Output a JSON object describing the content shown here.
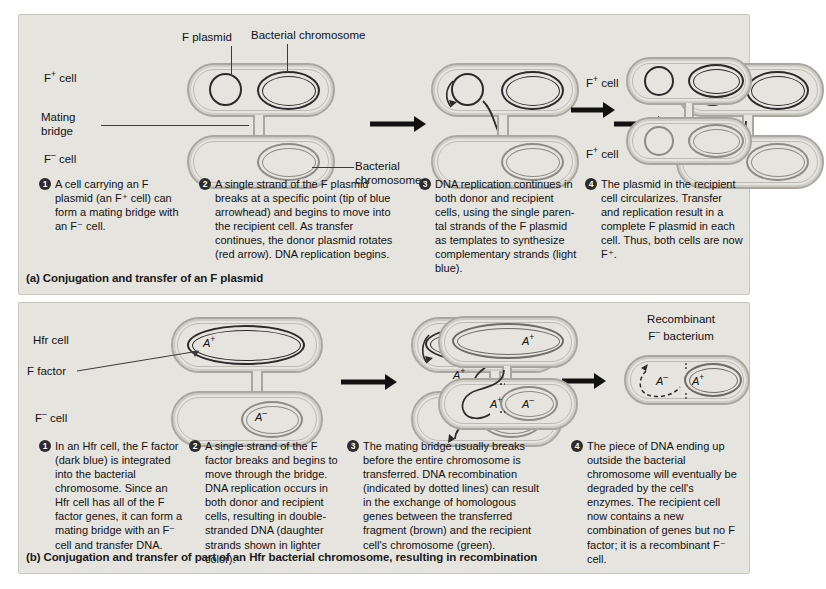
{
  "panel_a": {
    "caption": "(a) Conjugation and transfer of an F plasmid",
    "labels": {
      "f_plasmid": "F plasmid",
      "bacterial_chromosome_top": "Bacterial chromosome",
      "bacterial_chromosome_bottom_line1": "Bacterial",
      "bacterial_chromosome_bottom_line2": "chromosome",
      "mating_bridge_line1": "Mating",
      "mating_bridge_line2": "bridge",
      "f_plus_cell": "F",
      "f_plus_sup": "+",
      "f_plus_cell_suffix": " cell",
      "f_minus_cell": "F",
      "f_minus_sup": "–",
      "f_minus_cell_suffix": " cell",
      "result_cell_top": "F",
      "result_cell_top_sup": "+",
      "result_cell_top_suffix": " cell",
      "result_cell_bottom": "F",
      "result_cell_bottom_sup": "+",
      "result_cell_bottom_suffix": " cell"
    },
    "steps": [
      {
        "num": "1",
        "text": "A cell carrying an F plasmid (an F⁺ cell) can form a mating bridge with an F⁻ cell."
      },
      {
        "num": "2",
        "text": "A single strand of the F plasmid breaks at a specific point (tip of blue arrowhead) and begins to move into the recipient cell. As transfer continues, the donor plasmid rotates (red arrow). DNA replication begins."
      },
      {
        "num": "3",
        "text": "DNA replication continues in both donor and recipient cells, using the single paren-tal strands of the F plasmid as templates to synthesize complementary strands (light blue)."
      },
      {
        "num": "4",
        "text": "The plasmid in the recipient cell circularizes. Transfer and replication result in a complete F plasmid in each cell. Thus, both cells are now F⁺."
      }
    ]
  },
  "panel_b": {
    "caption": "(b) Conjugation and transfer of part of an Hfr bacterial chromosome, resulting in recombination",
    "labels": {
      "hfr_cell": "Hfr cell",
      "f_factor": "F factor",
      "f_minus_cell": "F",
      "f_minus_sup": "–",
      "f_minus_cell_suffix": " cell",
      "recombinant_line1": "Recombinant",
      "recombinant_line2": "F",
      "recombinant_line2_sup": "–",
      "recombinant_line2_suffix": " bacterium"
    },
    "genes": {
      "a_plus": "A",
      "a_plus_sup": "+",
      "a_minus": "A",
      "a_minus_sup": "–"
    },
    "steps": [
      {
        "num": "1",
        "text": "In an Hfr cell, the F factor (dark blue) is integrated into the bacterial chromosome. Since an Hfr cell has all of the F factor genes, it can form a mating bridge with an F⁻ cell and transfer DNA."
      },
      {
        "num": "2",
        "text": "A single strand of the F factor breaks and begins to move through the bridge. DNA replication occurs in both donor and recipient cells, resulting in double-stranded DNA (daughter strands shown in lighter color)."
      },
      {
        "num": "3",
        "text": "The mating bridge usually breaks before the entire chromosome is transferred. DNA recombination (indicated by dotted lines) can result in the exchange of homologous genes between the transferred fragment (brown) and the recipient cell's chromosome (green)."
      },
      {
        "num": "4",
        "text": "The piece of DNA ending up outside the bacterial chromosome will eventually be degraded by the cell's enzymes. The recipient cell now contains a new combination of genes but no F factor; it is a recombinant F⁻ cell."
      }
    ]
  },
  "colors": {
    "panel_background": "#e6e4df",
    "page_background": "#ffffff",
    "chromosome_dark": "#2b2b2b",
    "chromosome_light": "#8e8b86",
    "cell_membrane": "#a9a6a0",
    "arrow": "#111111",
    "text": "#111111"
  }
}
